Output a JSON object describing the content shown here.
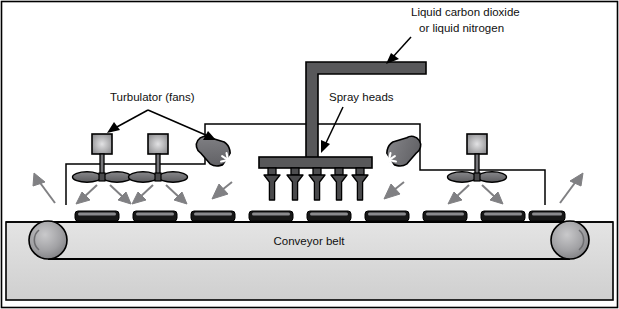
{
  "figure": {
    "background": "#ffffff",
    "border_color": "#000000"
  },
  "labels": {
    "cryogen_line1": "Liquid carbon dioxide",
    "cryogen_line2": "or liquid nitrogen",
    "turbulator": "Turbulator (fans)",
    "spray_heads": "Spray heads",
    "conveyor": "Conveyor belt"
  },
  "colors": {
    "outline": "#000000",
    "pipe_fill": "#58585a",
    "pipe_stroke": "#000000",
    "nozzle_fill": "#4e4e50",
    "plume_fill": "#4a4a4c",
    "blower_fill": "#6d6d70",
    "fan_blade_fill": "#67676a",
    "motor_box_fill": "#9a9a9c",
    "motor_box_highlight": "#d4d4d6",
    "airflow_arrow": "#808083",
    "belt_frame_fill": "#dcdcdc",
    "belt_band_fill": "#d2d2d2",
    "roller_fill": "#9c9c9f",
    "roller_highlight": "#c8c8ca",
    "product_fill": "#171717",
    "product_top": "#8a8a8d",
    "duct_line": "#000000",
    "leader_line": "#000000"
  },
  "components": {
    "supply_pipe": {
      "name": "L-shaped cryogen supply pipe",
      "horizontal_run_x": [
        306,
        426
      ],
      "vertical_drop_y": [
        62,
        160
      ],
      "thickness": 7
    },
    "spray_manifold": {
      "name": "Spray manifold bar",
      "x": 260,
      "y": 158,
      "width": 110,
      "height": 10
    },
    "spray_nozzles": {
      "count": 5,
      "x_positions": [
        272,
        295,
        317,
        339,
        360
      ],
      "plume_top": 170,
      "plume_bottom": 200
    },
    "fan_units": {
      "count": 3,
      "x_positions": [
        102,
        152,
        474
      ],
      "motor_box_size": 19,
      "motor_box_top": 134,
      "blade_y": 175,
      "blade_rx": 15,
      "blade_ry": 5.5
    },
    "blowers": {
      "count": 2,
      "x_positions": [
        228,
        389
      ],
      "rotation_deg": [
        35,
        -35
      ],
      "impeller_symbol": "asterisk"
    },
    "airflow_arrows": {
      "count": 10,
      "description": "Gray arrows showing turbulent air circulation around fans and blowers"
    },
    "conveyor": {
      "frame": {
        "x": 6,
        "y": 222,
        "width": 607,
        "height": 78
      },
      "band_top_y": 222,
      "band_bottom_y": 260,
      "rollers": [
        {
          "name": "left-roller",
          "cx": 48,
          "cy": 240,
          "r": 19
        },
        {
          "name": "right-roller",
          "cx": 570,
          "cy": 240,
          "r": 19
        }
      ],
      "products": {
        "count": 9,
        "x_positions": [
          75,
          133,
          191,
          249,
          307,
          365,
          423,
          481,
          529
        ],
        "y": 211,
        "width": 44,
        "height": 9
      }
    },
    "duct_frames": [
      {
        "name": "left-duct-frame",
        "x_left": 66,
        "x_right": 205,
        "y_top": 124,
        "y_bottom": 205
      },
      {
        "name": "right-duct-frame",
        "x_left": 205,
        "x_right": 545,
        "y_top": 124,
        "y_bottom": 205
      }
    ]
  },
  "leaders": {
    "cryogen_arrow": {
      "from": [
        409,
        16
      ],
      "to": [
        389,
        49
      ]
    },
    "turbulator_arrow_left": {
      "from": [
        148,
        110
      ],
      "to": [
        107,
        132
      ]
    },
    "turbulator_arrow_right": {
      "from": [
        148,
        110
      ],
      "to": [
        217,
        140
      ]
    },
    "spray_arrow": {
      "from": [
        343,
        107
      ],
      "to": [
        320,
        152
      ]
    }
  }
}
